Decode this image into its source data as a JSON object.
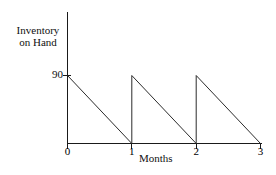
{
  "chart_data": {
    "type": "line",
    "title": "",
    "subtitle": "",
    "xlabel": "Months",
    "ylabel": "Inventory on Hand",
    "ylabel_lines": [
      "Inventory",
      "on Hand"
    ],
    "x": [
      0,
      1,
      1,
      2,
      2,
      3
    ],
    "values": [
      90,
      0,
      90,
      0,
      90,
      0
    ],
    "series": [
      {
        "name": "Inventory on Hand",
        "x": [
          0,
          1,
          1,
          2,
          2,
          3
        ],
        "values": [
          90,
          0,
          90,
          0,
          90,
          0
        ]
      }
    ],
    "xticks": [
      0,
      1,
      2,
      3
    ],
    "xticklabels": [
      "0",
      "1",
      "2",
      "3"
    ],
    "yticks": [
      90
    ],
    "yticklabels": [
      "90"
    ],
    "xlim": [
      0,
      3
    ],
    "ylim": [
      0,
      90
    ],
    "grid": false,
    "legend": false,
    "legend_position": "none",
    "annotations": []
  },
  "axes": {
    "y_axis_name": "y-axis",
    "x_axis_name": "x-axis",
    "line_color": "#1a1a1a",
    "series_color": "#2b2b2b",
    "background_color": "#ffffff"
  },
  "labels": {
    "y_title_line1": "Inventory",
    "y_title_line2": "on Hand",
    "y_tick_90": "90",
    "x_title": "Months",
    "x_tick_0": "0",
    "x_tick_1": "1",
    "x_tick_2": "2",
    "x_tick_3": "3"
  }
}
